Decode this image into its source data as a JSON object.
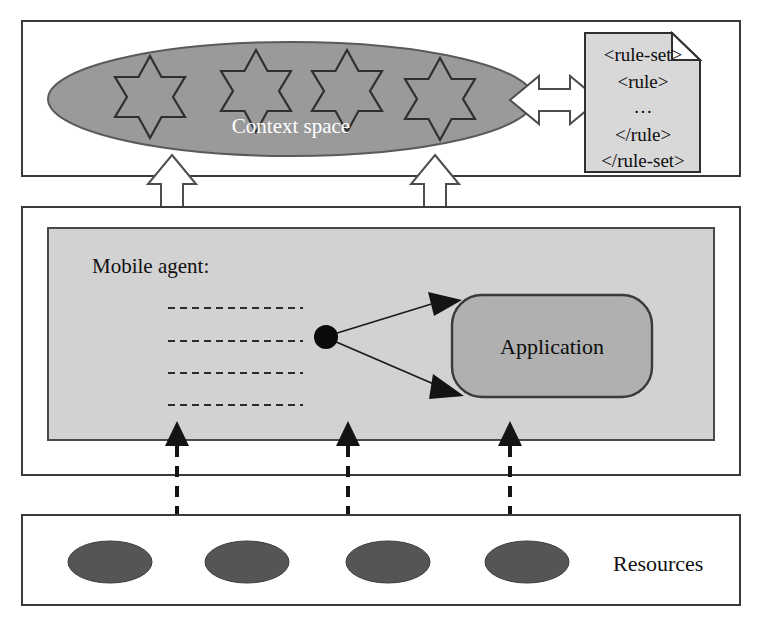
{
  "diagram": {
    "colors": {
      "context_space_fill": "#9a9a9a",
      "agent_box_fill": "#d2d2d2",
      "application_fill": "#b0b0b0",
      "document_fill": "#d8d8d8",
      "resource_fill": "#555555",
      "panel_stroke": "#3a3a3a",
      "arrow_hollow_fill": "#ffffff"
    },
    "layers": [
      {
        "id": "context-layer",
        "name": "Context layer",
        "context_space": {
          "label": "Context space",
          "star_count": 4,
          "star_icon_name": "six-pointed-star-icon"
        },
        "rule_document": {
          "icon_name": "document-icon",
          "lines": [
            "<rule-set>",
            "<rule>",
            "…",
            "</rule>",
            "</rule-set>"
          ]
        },
        "bidirectional_arrow": {
          "icon_name": "double-headed-horizontal-arrow-icon",
          "from": "Context space",
          "to": "rule-set document"
        }
      },
      {
        "id": "agent-layer",
        "name": "Mobile agent layer",
        "agent_label": "Mobile agent:",
        "code_line_count": 4,
        "node_dot_name": "agent-node-dot",
        "application": {
          "label": "Application"
        },
        "connector_arrow_count": 2
      },
      {
        "id": "resource-layer",
        "name": "Resource layer",
        "label": "Resources",
        "resource_count": 4,
        "resource_icon_name": "resource-ellipse-icon"
      }
    ],
    "connectors": {
      "context_to_agent": {
        "icon_name": "double-headed-vertical-hollow-arrow-icon",
        "count": 2,
        "style": "hollow-block"
      },
      "agent_to_resources": {
        "icon_name": "double-headed-vertical-dashed-arrow-icon",
        "count": 3,
        "style": "dashed-solid-head"
      }
    }
  }
}
